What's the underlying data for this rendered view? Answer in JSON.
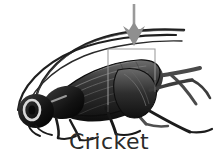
{
  "figure": {
    "caption": "Cricket",
    "background_color": "#ffffff",
    "caption_color": "#2b2b2b",
    "ink_color": "#1a1a1a",
    "annotation": {
      "arrow": {
        "name": "pointer-arrow",
        "color": "#9a9a9a",
        "direction": "down",
        "shaft_x": 134,
        "shaft_top_y": 4,
        "tip_y": 46
      },
      "highlight_box": {
        "name": "highlight-rectangle",
        "color": "#9a9a9a",
        "x": 108,
        "y": 49,
        "width": 47,
        "height": 56
      }
    },
    "parts": [
      {
        "name": "antenna-upper",
        "label": "antenna"
      },
      {
        "name": "antenna-lower",
        "label": "antenna"
      },
      {
        "name": "head",
        "label": "head"
      },
      {
        "name": "eye",
        "label": "compound eye"
      },
      {
        "name": "pronotum",
        "label": "pronotum"
      },
      {
        "name": "wing",
        "label": "forewing"
      },
      {
        "name": "abdomen",
        "label": "abdomen"
      },
      {
        "name": "hind-leg",
        "label": "hind leg"
      },
      {
        "name": "middle-leg",
        "label": "middle leg"
      },
      {
        "name": "front-leg",
        "label": "front leg"
      }
    ]
  }
}
